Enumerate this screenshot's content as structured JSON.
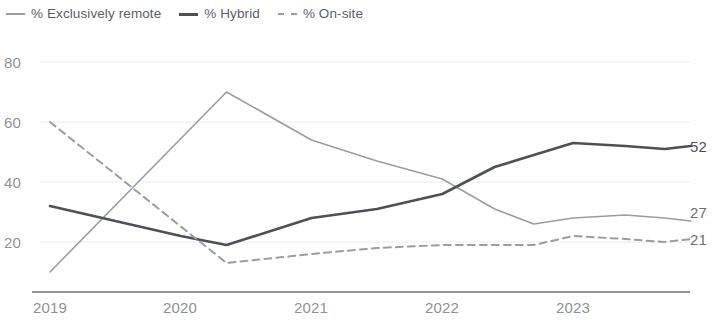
{
  "legend": {
    "items": [
      {
        "label": "% Exclusively remote",
        "marker": "solid-thin",
        "color": "#9a9da2"
      },
      {
        "label": "% Hybrid",
        "marker": "solid-thick",
        "color": "#4d5156"
      },
      {
        "label": "% On-site",
        "marker": "dashed",
        "color": "#9a9da2"
      }
    ]
  },
  "axis": {
    "y_ticks": [
      "80",
      "60",
      "40",
      "20"
    ],
    "x_ticks": [
      "2019",
      "2020",
      "2021",
      "2022",
      "2023"
    ]
  },
  "end_labels": [
    {
      "value": "52",
      "series": "% Hybrid"
    },
    {
      "value": "27",
      "series": "% Exclusively remote"
    },
    {
      "value": "21",
      "series": "% On-site"
    }
  ],
  "chart_data": {
    "type": "line",
    "title": "",
    "xlabel": "",
    "ylabel": "",
    "xlim": [
      2019.0,
      2023.9
    ],
    "ylim": [
      0,
      88
    ],
    "yticks": [
      20,
      40,
      60,
      80
    ],
    "xticks": [
      2019,
      2020,
      2021,
      2022,
      2023
    ],
    "grid": true,
    "legend_position": "top-left",
    "annotations": [
      {
        "text": "52",
        "series": "% Hybrid",
        "x": 2023.9,
        "y": 52
      },
      {
        "text": "27",
        "series": "% Exclusively remote",
        "x": 2023.9,
        "y": 27
      },
      {
        "text": "21",
        "series": "% On-site",
        "x": 2023.9,
        "y": 21
      }
    ],
    "series": [
      {
        "name": "% Exclusively remote",
        "style": "solid",
        "width": 1.6,
        "color": "#9a9da2",
        "x": [
          2019.0,
          2020.35,
          2021.0,
          2021.5,
          2022.0,
          2022.4,
          2022.7,
          2023.0,
          2023.4,
          2023.7,
          2023.9
        ],
        "y": [
          10,
          70,
          54,
          47,
          41,
          31,
          26,
          28,
          29,
          28,
          27
        ]
      },
      {
        "name": "% Hybrid",
        "style": "solid",
        "width": 2.6,
        "color": "#4d5156",
        "x": [
          2019.0,
          2020.0,
          2020.35,
          2021.0,
          2021.5,
          2022.0,
          2022.4,
          2022.7,
          2023.0,
          2023.4,
          2023.7,
          2023.9
        ],
        "y": [
          32,
          22,
          19,
          28,
          31,
          36,
          45,
          49,
          53,
          52,
          51,
          52
        ]
      },
      {
        "name": "% On-site",
        "style": "dashed",
        "width": 2.0,
        "color": "#9a9da2",
        "x": [
          2019.0,
          2020.35,
          2021.0,
          2021.5,
          2022.0,
          2022.4,
          2022.7,
          2023.0,
          2023.4,
          2023.7,
          2023.9
        ],
        "y": [
          60,
          13,
          16,
          18,
          19,
          19,
          19,
          22,
          21,
          20,
          21
        ]
      }
    ]
  }
}
